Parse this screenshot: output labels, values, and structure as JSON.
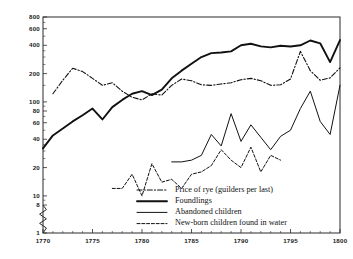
{
  "figure": {
    "background": "#ffffff",
    "ink": "#111111"
  },
  "chart_data": {
    "type": "line",
    "title": "",
    "subtitle": "",
    "xlabel": "",
    "ylabel": "",
    "yscale": "log",
    "grid": false,
    "legend_position": "inside-bottom-right",
    "xlim": [
      1770,
      1800
    ],
    "ylim": [
      1,
      800
    ],
    "x_ticks": [
      1770,
      1775,
      1780,
      1785,
      1790,
      1795,
      1800
    ],
    "x_tick_labels": [
      "1770",
      "1775",
      "1780",
      "1785",
      "1790",
      "1795",
      "1800"
    ],
    "y_ticks": [
      1,
      8,
      10,
      20,
      40,
      60,
      80,
      100,
      200,
      400,
      600,
      800
    ],
    "y_tick_labels": [
      "1",
      "8",
      "10",
      "20",
      "40",
      "60",
      "80",
      "100",
      "200",
      "400",
      "600",
      "800"
    ],
    "axis_break": {
      "between": [
        1,
        8
      ],
      "style": "zigzag"
    },
    "series": [
      {
        "name": "Price of rye (guilders per last)",
        "style": "dash-dot",
        "x": [
          1771,
          1772,
          1773,
          1774,
          1775,
          1776,
          1777,
          1778,
          1779,
          1780,
          1781,
          1782,
          1783,
          1784,
          1785,
          1786,
          1787,
          1788,
          1789,
          1790,
          1791,
          1792,
          1793,
          1794,
          1795,
          1796,
          1797,
          1798,
          1799,
          1800
        ],
        "values": [
          122,
          170,
          228,
          210,
          178,
          150,
          160,
          130,
          112,
          105,
          122,
          118,
          150,
          175,
          168,
          152,
          150,
          155,
          160,
          172,
          178,
          168,
          150,
          152,
          175,
          345,
          215,
          170,
          180,
          230
        ]
      },
      {
        "name": "Foundlings",
        "style": "solid-thick",
        "x": [
          1770,
          1771,
          1772,
          1773,
          1774,
          1775,
          1776,
          1777,
          1778,
          1779,
          1780,
          1781,
          1782,
          1783,
          1784,
          1785,
          1786,
          1787,
          1788,
          1789,
          1790,
          1791,
          1792,
          1793,
          1794,
          1795,
          1796,
          1797,
          1798,
          1799,
          1800
        ],
        "values": [
          32,
          44,
          52,
          62,
          72,
          85,
          65,
          88,
          105,
          122,
          130,
          118,
          135,
          178,
          215,
          255,
          300,
          330,
          335,
          345,
          400,
          415,
          390,
          380,
          395,
          388,
          400,
          450,
          420,
          265,
          455
        ]
      },
      {
        "name": "Abandoned children",
        "style": "solid-thin",
        "x": [
          1783,
          1784,
          1785,
          1786,
          1787,
          1788,
          1789,
          1790,
          1791,
          1792,
          1793,
          1794,
          1795,
          1796,
          1797,
          1798,
          1799,
          1800
        ],
        "values": [
          23,
          23,
          24,
          27,
          45,
          34,
          75,
          38,
          57,
          42,
          31,
          43,
          50,
          85,
          130,
          62,
          45,
          150
        ]
      },
      {
        "name": "New-born children found in water",
        "style": "dashed",
        "x": [
          1777,
          1778,
          1779,
          1780,
          1781,
          1782,
          1783,
          1784,
          1785,
          1786,
          1787,
          1788,
          1789,
          1790,
          1791,
          1792,
          1793,
          1794
        ],
        "values": [
          12,
          12,
          17,
          10,
          22,
          14,
          15,
          12,
          17,
          18,
          21,
          31,
          24,
          20,
          33,
          18,
          27,
          24
        ]
      }
    ],
    "legend": [
      {
        "label": "Price of rye (guilders per last)",
        "style": "dash-dot"
      },
      {
        "label": "Foundlings",
        "style": "solid-thick"
      },
      {
        "label": "Abandoned children",
        "style": "solid-thin"
      },
      {
        "label": "New-born children found in water",
        "style": "dashed"
      }
    ]
  }
}
